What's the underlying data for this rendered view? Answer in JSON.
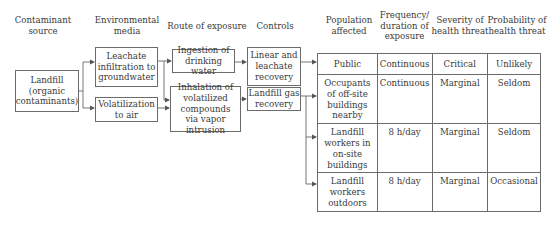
{
  "headers": {
    "contaminant_source": "Contaminant source",
    "environmental_media": "Environmental media",
    "route_of_exposure": "Route of exposure",
    "controls": "Controls",
    "population_affected": "Population affected",
    "frequency": "Frequency/ duration of exposure",
    "severity": "Severity of health threat",
    "probability": "Probability of health threat"
  },
  "nodes": {
    "source": "Landfill (organic contaminants)",
    "media": [
      "Leachate infiltration to groundwater",
      "Volatilization to air"
    ],
    "routes": [
      "Ingestion of drinking water",
      "Inhalation of volatilized compounds via vapor intrusion"
    ],
    "controls": [
      "Linear and leachate recovery",
      "Landfill gas recovery"
    ]
  },
  "table": {
    "rows": [
      {
        "population": "Public",
        "frequency": "Continuous",
        "severity": "Critical",
        "probability": "Unlikely"
      },
      {
        "population": "Occupants of off-site buildings nearby",
        "frequency": "Continuous",
        "severity": "Marginal",
        "probability": "Seldom"
      },
      {
        "population": "Landfill workers in on-site buildings",
        "frequency": "8 h/day",
        "severity": "Marginal",
        "probability": "Seldom"
      },
      {
        "population": "Landfill workers outdoors",
        "frequency": "8 h/day",
        "severity": "Marginal",
        "probability": "Occasional"
      }
    ]
  },
  "colors": {
    "line": "#6b6b6b",
    "text": "#3a3a3a"
  }
}
